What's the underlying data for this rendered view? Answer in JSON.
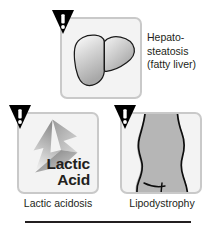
{
  "figure": {
    "background_color": "#ffffff",
    "text_color": "#231f20",
    "panel_border_color": "#c9c9c9",
    "panel_fill_color": "#f3f3f3",
    "rule_color": "#231f20"
  },
  "panels": [
    {
      "id": "hepatosteatosis",
      "icon_name": "liver-illustration",
      "warning_icon": "warning-triangle-exclamation",
      "label_lines": [
        "Hepato-",
        "steatosis",
        "(fatty liver)"
      ],
      "label_position": "right"
    },
    {
      "id": "lactic-acidosis",
      "icon_name": "upward-arrow-illustration",
      "warning_icon": "warning-triangle-exclamation",
      "overlay_lines": [
        "Lactic",
        "Acid"
      ],
      "caption": "Lactic acidosis"
    },
    {
      "id": "lipodystrophy",
      "icon_name": "body-torso-illustration",
      "warning_icon": "warning-triangle-exclamation",
      "caption": "Lipodystrophy"
    }
  ]
}
